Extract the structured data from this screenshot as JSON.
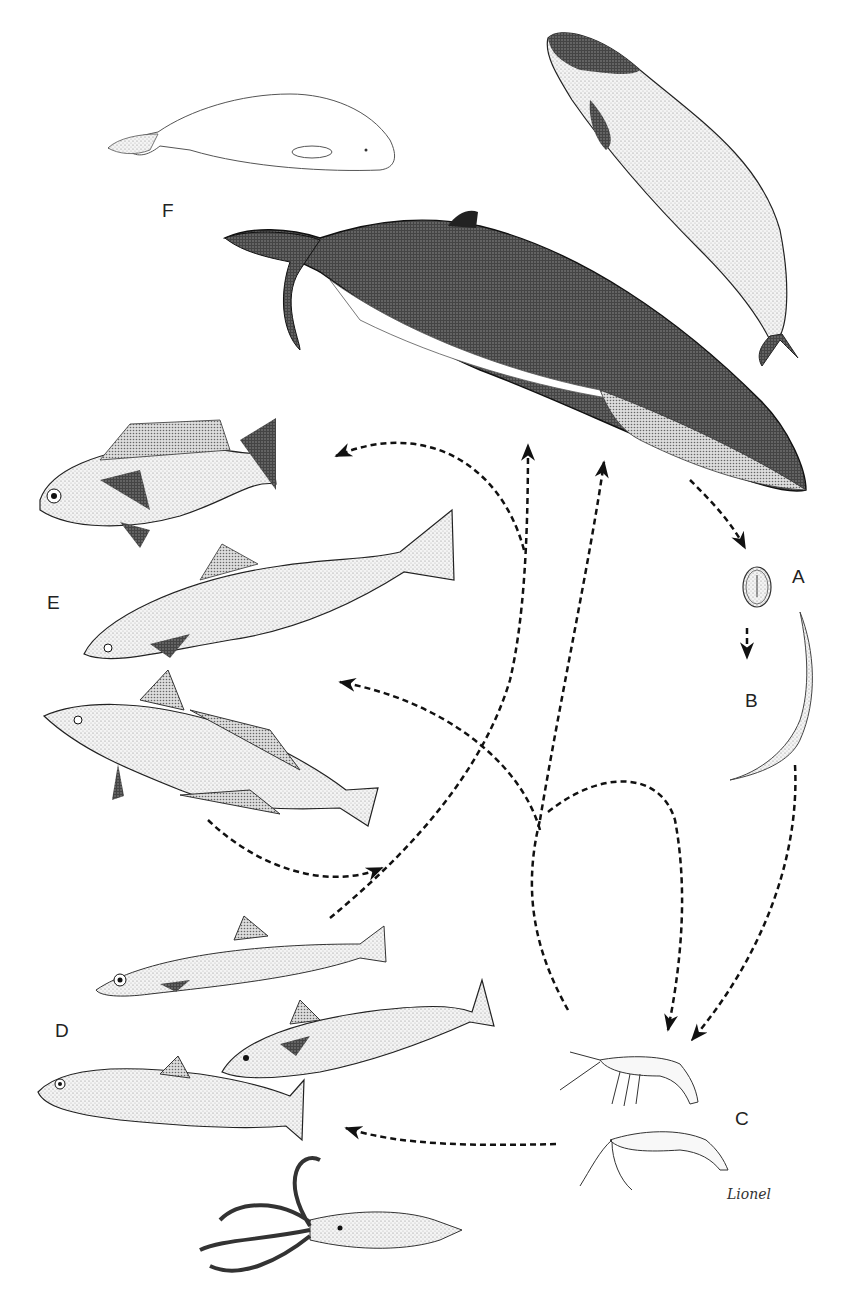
{
  "figure": {
    "labels": {
      "A": "A",
      "B": "B",
      "C": "C",
      "D": "D",
      "E": "E",
      "F": "F"
    },
    "stages": {
      "A": "egg",
      "B": "free-living larva",
      "C": "crustacean intermediate hosts (krill / shrimp)",
      "D": "small fish and squid paratenic hosts",
      "E": "larger predatory fish paratenic hosts",
      "F": "marine mammal definitive hosts (beluga, porpoise, whale)"
    },
    "signature": "Lionel",
    "colors": {
      "ink": "#111111",
      "shade": "#555555",
      "light": "#bbbbbb",
      "background": "#ffffff"
    }
  }
}
